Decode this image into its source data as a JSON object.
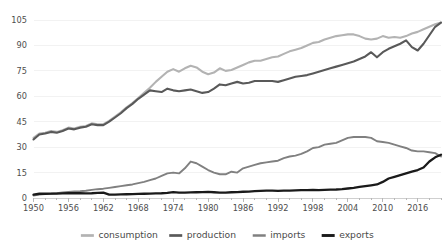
{
  "chart_data": {
    "type": "line",
    "title": "",
    "subtitle": "",
    "xlabel": "",
    "ylabel": "",
    "xlim": [
      1950,
      2020
    ],
    "ylim": [
      0,
      105
    ],
    "grid": true,
    "legend_position": "bottom",
    "yticks": [
      0,
      15,
      30,
      45,
      60,
      75,
      90,
      105
    ],
    "ytick_labels": [
      "0",
      "15",
      "30",
      "45",
      "60",
      "75",
      "90",
      "105"
    ],
    "xticks": [
      1950,
      1956,
      1962,
      1968,
      1974,
      1980,
      1986,
      1992,
      1998,
      2004,
      2010,
      2016
    ],
    "xtick_labels": [
      "1950",
      "1956",
      "1962",
      "1968",
      "1974",
      "1980",
      "1986",
      "1992",
      "1998",
      "2004",
      "2010",
      "2016"
    ],
    "x": [
      1950,
      1951,
      1952,
      1953,
      1954,
      1955,
      1956,
      1957,
      1958,
      1959,
      1960,
      1961,
      1962,
      1963,
      1964,
      1965,
      1966,
      1967,
      1968,
      1969,
      1970,
      1971,
      1972,
      1973,
      1974,
      1975,
      1976,
      1977,
      1978,
      1979,
      1980,
      1981,
      1982,
      1983,
      1984,
      1985,
      1986,
      1987,
      1988,
      1989,
      1990,
      1991,
      1992,
      1993,
      1994,
      1995,
      1996,
      1997,
      1998,
      1999,
      2000,
      2001,
      2002,
      2003,
      2004,
      2005,
      2006,
      2007,
      2008,
      2009,
      2010,
      2011,
      2012,
      2013,
      2014,
      2015,
      2016,
      2017,
      2018,
      2019,
      2020
    ],
    "series": [
      {
        "name": "consumption",
        "color": "#b3b3b3",
        "width": 2.1,
        "values": [
          35.5,
          38.0,
          38.5,
          39.5,
          39.0,
          40.0,
          41.5,
          41.0,
          42.0,
          42.5,
          44.0,
          43.5,
          43.5,
          45.5,
          48.0,
          50.5,
          53.5,
          56.0,
          59.0,
          62.0,
          65.0,
          68.5,
          71.5,
          74.5,
          76.0,
          74.5,
          76.5,
          78.0,
          77.0,
          74.5,
          73.0,
          74.0,
          76.5,
          75.0,
          75.5,
          77.0,
          78.5,
          80.0,
          81.0,
          81.0,
          82.0,
          83.0,
          83.5,
          85.0,
          86.5,
          87.5,
          88.5,
          90.0,
          91.5,
          92.0,
          93.5,
          94.5,
          95.5,
          96.0,
          96.5,
          96.5,
          95.5,
          94.0,
          93.5,
          94.0,
          95.5,
          94.5,
          95.0,
          94.5,
          95.5,
          97.0,
          98.0,
          99.5,
          101.0,
          102.5,
          103.5
        ]
      },
      {
        "name": "production",
        "color": "#595959",
        "width": 2.1,
        "values": [
          34.5,
          37.5,
          38.0,
          39.0,
          38.5,
          39.5,
          41.0,
          40.5,
          41.5,
          42.0,
          43.5,
          43.0,
          43.0,
          45.0,
          47.5,
          50.0,
          53.0,
          55.5,
          58.5,
          61.0,
          63.5,
          63.0,
          62.5,
          64.5,
          63.5,
          63.0,
          63.5,
          64.0,
          63.0,
          62.0,
          62.5,
          64.5,
          67.0,
          66.5,
          67.5,
          68.5,
          67.5,
          68.0,
          69.0,
          69.0,
          69.0,
          69.0,
          68.5,
          69.5,
          70.5,
          71.5,
          72.0,
          72.5,
          73.5,
          74.5,
          75.5,
          76.5,
          77.5,
          78.5,
          79.5,
          80.5,
          82.0,
          83.5,
          86.0,
          83.0,
          86.0,
          88.0,
          89.5,
          91.0,
          93.0,
          89.0,
          87.0,
          91.0,
          96.0,
          101.0,
          103.5
        ]
      },
      {
        "name": "imports",
        "color": "#808080",
        "width": 1.9,
        "values": [
          1.5,
          2.0,
          2.3,
          2.5,
          2.8,
          3.3,
          3.6,
          3.8,
          4.0,
          4.3,
          4.8,
          5.2,
          5.5,
          6.0,
          6.5,
          7.0,
          7.5,
          8.0,
          8.8,
          9.5,
          10.5,
          11.5,
          13.0,
          14.5,
          15.0,
          14.5,
          17.5,
          21.5,
          20.5,
          18.5,
          16.5,
          15.0,
          14.0,
          14.0,
          15.5,
          15.0,
          17.5,
          18.5,
          19.5,
          20.5,
          21.0,
          21.5,
          22.0,
          23.5,
          24.5,
          25.0,
          26.0,
          27.5,
          29.5,
          30.0,
          31.5,
          32.0,
          32.5,
          34.0,
          35.5,
          36.0,
          36.0,
          36.0,
          35.5,
          33.5,
          33.0,
          32.5,
          31.5,
          30.5,
          29.5,
          28.0,
          27.5,
          27.5,
          27.0,
          26.5,
          24.5
        ]
      },
      {
        "name": "exports",
        "color": "#1a1a1a",
        "width": 2.3,
        "values": [
          2.0,
          2.5,
          2.5,
          2.6,
          2.6,
          2.7,
          2.8,
          2.9,
          2.8,
          2.7,
          2.8,
          3.0,
          3.2,
          2.0,
          2.0,
          2.1,
          2.2,
          2.3,
          2.4,
          2.5,
          2.6,
          2.7,
          2.8,
          3.0,
          3.5,
          3.2,
          3.2,
          3.3,
          3.4,
          3.5,
          3.6,
          3.4,
          3.2,
          3.2,
          3.4,
          3.5,
          3.7,
          3.8,
          4.0,
          4.2,
          4.4,
          4.3,
          4.2,
          4.3,
          4.4,
          4.5,
          4.6,
          4.7,
          4.8,
          4.7,
          4.8,
          4.9,
          5.0,
          5.2,
          5.6,
          6.0,
          6.5,
          7.0,
          7.5,
          8.0,
          9.5,
          11.5,
          12.5,
          13.5,
          14.5,
          15.5,
          16.5,
          18.0,
          21.5,
          24.0,
          25.5
        ]
      }
    ]
  },
  "legend": {
    "items": [
      {
        "label": "consumption",
        "color": "#b3b3b3"
      },
      {
        "label": "production",
        "color": "#595959"
      },
      {
        "label": "imports",
        "color": "#808080"
      },
      {
        "label": "exports",
        "color": "#1a1a1a"
      }
    ]
  },
  "colors": {
    "background": "#ffffff",
    "grid": "#f2f2f2",
    "axis": "#cfcfcf",
    "tick_text": "#4d4d4d",
    "legend_text": "#4a4a4a"
  }
}
